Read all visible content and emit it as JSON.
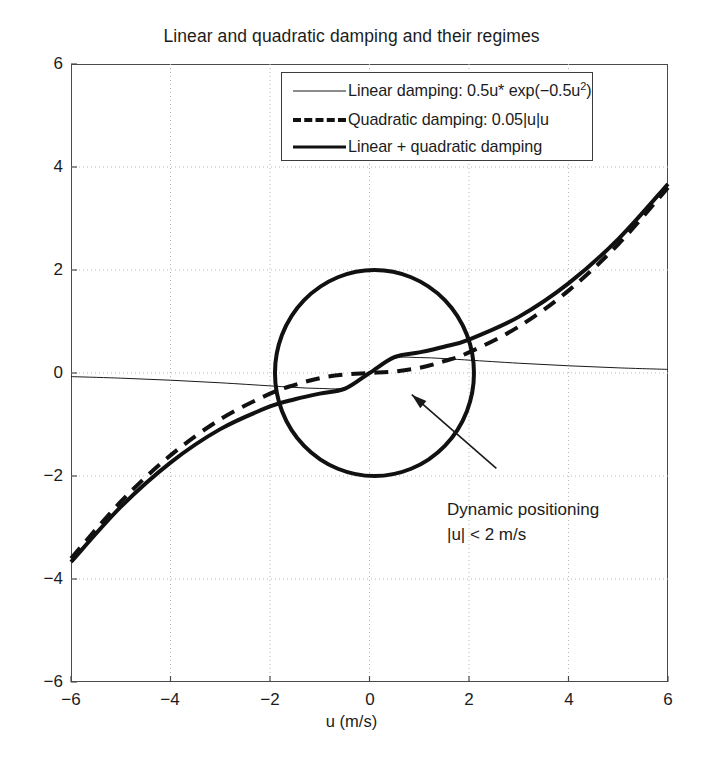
{
  "figure": {
    "title": "Linear and quadratic damping and their regimes",
    "xlabel": "u (m/s)",
    "ylabel": ""
  },
  "legend": {
    "entries": [
      {
        "label_prefix": "Linear damping: 0.5u* exp(−0.5u",
        "label_sup": "2",
        "label_suffix": ")",
        "style": "thin-solid"
      },
      {
        "label_prefix": "Quadratic damping: 0.05|u|u",
        "label_sup": "",
        "label_suffix": "",
        "style": "thick-dashed"
      },
      {
        "label_prefix": "Linear + quadratic damping",
        "label_sup": "",
        "label_suffix": "",
        "style": "thick-solid"
      }
    ]
  },
  "annotation": {
    "line1": "Dynamic positioning",
    "line2": "|u| < 2 m/s"
  },
  "axis_ticks": {
    "x": [
      "−6",
      "−4",
      "−2",
      "0",
      "2",
      "4",
      "6"
    ],
    "y": [
      "6",
      "4",
      "2",
      "0",
      "−2",
      "−4",
      "−6"
    ]
  },
  "chart_data": {
    "type": "line",
    "title": "Linear and quadratic damping and their regimes",
    "xlabel": "u (m/s)",
    "ylabel": "",
    "xlim": [
      -6,
      6
    ],
    "ylim": [
      -6,
      6
    ],
    "xticks": [
      -6,
      -4,
      -2,
      0,
      2,
      4,
      6
    ],
    "yticks": [
      -6,
      -4,
      -2,
      0,
      2,
      4,
      6
    ],
    "grid": true,
    "grid_style": "dotted",
    "legend_position": "upper center",
    "series": [
      {
        "name": "Linear damping: 0.5u* exp(-0.5u^2)",
        "formula": "0.5*u*exp(-0.5*u)",
        "style": "thin-solid",
        "linewidth": 1,
        "color": "#1a1a1a",
        "x": [
          -6,
          -5,
          -4,
          -3,
          -2,
          -1.5,
          -1,
          -0.5,
          0,
          0.5,
          1,
          1.5,
          2,
          3,
          4,
          5,
          6
        ],
        "y": [
          -0.07,
          -0.1,
          -0.14,
          -0.19,
          -0.25,
          -0.28,
          -0.3,
          -0.28,
          0.0,
          0.28,
          0.3,
          0.28,
          0.25,
          0.19,
          0.14,
          0.1,
          0.07
        ]
      },
      {
        "name": "Quadratic damping: 0.05|u|u",
        "formula": "0.05*abs(u)*u*K",
        "style": "thick-dashed",
        "linewidth": 4,
        "color": "#111111",
        "x": [
          -6,
          -5,
          -4,
          -3,
          -2,
          -1.5,
          -1,
          -0.5,
          0,
          0.5,
          1,
          1.5,
          2,
          3,
          4,
          5,
          6
        ],
        "y": [
          -3.6,
          -2.5,
          -1.6,
          -0.9,
          -0.4,
          -0.23,
          -0.1,
          -0.03,
          0.0,
          0.03,
          0.1,
          0.23,
          0.4,
          0.9,
          1.6,
          2.5,
          3.6
        ]
      },
      {
        "name": "Linear + quadratic damping",
        "formula": "linear + quadratic",
        "style": "thick-solid",
        "linewidth": 4,
        "color": "#111111",
        "x": [
          -6,
          -5,
          -4,
          -3,
          -2,
          -1.5,
          -1,
          -0.5,
          0,
          0.5,
          1,
          1.5,
          2,
          3,
          4,
          5,
          6
        ],
        "y": [
          -3.67,
          -2.6,
          -1.74,
          -1.09,
          -0.65,
          -0.51,
          -0.4,
          -0.31,
          0.0,
          0.31,
          0.4,
          0.51,
          0.65,
          1.09,
          1.74,
          2.6,
          3.67
        ]
      }
    ],
    "shapes": [
      {
        "kind": "circle",
        "name": "dynamic-positioning-region",
        "center": [
          0.1,
          0.0
        ],
        "radius": 2.0,
        "linewidth": 4,
        "color": "#111111",
        "filled": false
      },
      {
        "kind": "arrow",
        "name": "annotation-arrow",
        "from": [
          2.55,
          -1.85
        ],
        "to": [
          0.85,
          -0.42
        ],
        "color": "#1a1a1a"
      }
    ],
    "annotations": [
      {
        "text": "Dynamic positioning",
        "x": 2.65,
        "y": -2.25
      },
      {
        "text": "|u| < 2 m/s",
        "x": 2.65,
        "y": -2.75
      }
    ]
  }
}
